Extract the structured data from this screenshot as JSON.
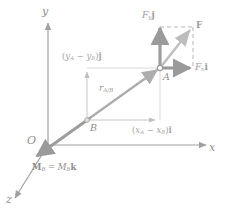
{
  "figure": {
    "colors": {
      "axis": "#a0a0a0",
      "thin_vector": "#bdbdbd",
      "bold_vector": "#9a9a9a",
      "dashed": "#b5b5b5",
      "text": "#8f8f8f",
      "background": "#ffffff"
    },
    "axes": {
      "y_label": "y",
      "x_label": "x",
      "z_label": "z",
      "origin_label": "O"
    },
    "points": [
      {
        "id": "A",
        "label": "A",
        "x": 160,
        "y": 68
      },
      {
        "id": "B",
        "label": "B",
        "x": 87,
        "y": 120
      }
    ],
    "vectors": [
      {
        "name": "force-y-component",
        "label_main": "F",
        "label_sub": "y",
        "label_unit": "j",
        "from": [
          160,
          68
        ],
        "to": [
          160,
          25
        ]
      },
      {
        "name": "force-x-component",
        "label_main": "F",
        "label_sub": "x",
        "label_unit": "i",
        "from": [
          160,
          68
        ],
        "to": [
          194,
          68
        ]
      },
      {
        "name": "resultant-force",
        "label_main": "F",
        "label_sub": "",
        "label_unit": "",
        "from": [
          160,
          68
        ],
        "to": [
          192,
          28
        ]
      },
      {
        "name": "position-vector-a-over-b",
        "label_main": "r",
        "label_sub": "A/B",
        "label_unit": "",
        "from": [
          87,
          120
        ],
        "to": [
          160,
          68
        ]
      },
      {
        "name": "moment-vector",
        "label_main": "M",
        "label_sub": "B",
        "label_unit": "k",
        "from": [
          87,
          120
        ],
        "to": [
          35,
          158
        ]
      },
      {
        "name": "delta-y-component",
        "label": "(y_A - y_B)j",
        "from": [
          87,
          120
        ],
        "to": [
          87,
          70
        ]
      },
      {
        "name": "delta-x-component",
        "label": "(x_A - x_B)i",
        "from": [
          87,
          120
        ],
        "to": [
          158,
          120
        ]
      }
    ],
    "labels": {
      "force_y": {
        "main": "F",
        "sub": "y",
        "unit": "j"
      },
      "force_x": {
        "main": "F",
        "sub": "x",
        "unit": "i"
      },
      "force_resultant": {
        "main": "F"
      },
      "r_ab": {
        "main": "r",
        "sub": "A/B"
      },
      "delta_y": {
        "open": "(",
        "a": "y",
        "a_sub": "A",
        "minus": " − ",
        "b": "y",
        "b_sub": "B",
        "close": ")",
        "unit": "j"
      },
      "delta_x": {
        "open": "(",
        "a": "x",
        "a_sub": "A",
        "minus": " − ",
        "b": "x",
        "b_sub": "B",
        "close": ")",
        "unit": "i"
      },
      "moment": {
        "m1": "M",
        "m1_sub": "B",
        "eq": " = ",
        "m2": "M",
        "m2_sub": "B",
        "unit": "k"
      },
      "point_a": "A",
      "point_b": "B",
      "origin": "O",
      "axis_x": "x",
      "axis_y": "y",
      "axis_z": "z"
    }
  }
}
